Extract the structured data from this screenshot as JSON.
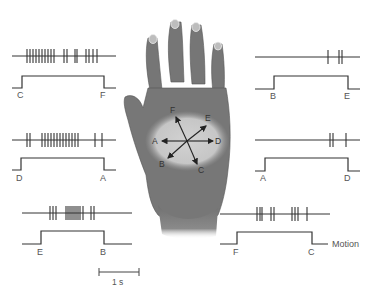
{
  "figure": {
    "scale_bar": {
      "label": "1 s"
    },
    "motion_label": "Motion",
    "hand": {
      "directions": [
        "A",
        "B",
        "C",
        "D",
        "E",
        "F"
      ],
      "arrows": [
        {
          "from": "center",
          "to": "A"
        },
        {
          "from": "center",
          "to": "B"
        },
        {
          "from": "center",
          "to": "C"
        },
        {
          "from": "center",
          "to": "D"
        },
        {
          "from": "center",
          "to": "E"
        },
        {
          "from": "center",
          "to": "F"
        }
      ]
    },
    "panels": [
      {
        "position": "top-left",
        "start": "C",
        "end": "F",
        "response": "strong"
      },
      {
        "position": "middle-left",
        "start": "D",
        "end": "A",
        "response": "strong"
      },
      {
        "position": "bottom-left",
        "start": "E",
        "end": "B",
        "response": "moderate"
      },
      {
        "position": "top-right",
        "start": "B",
        "end": "E",
        "response": "weak"
      },
      {
        "position": "middle-right",
        "start": "A",
        "end": "D",
        "response": "weak"
      },
      {
        "position": "bottom-right",
        "start": "F",
        "end": "C",
        "response": "moderate"
      }
    ]
  },
  "labels": {
    "tl_start": "C",
    "tl_end": "F",
    "ml_start": "D",
    "ml_end": "A",
    "bl_start": "E",
    "bl_end": "B",
    "tr_start": "B",
    "tr_end": "E",
    "mr_start": "A",
    "mr_end": "D",
    "br_start": "F",
    "br_end": "C",
    "dir_A": "A",
    "dir_B": "B",
    "dir_C": "C",
    "dir_D": "D",
    "dir_E": "E",
    "dir_F": "F",
    "scale": "1 s",
    "motion": "Motion"
  },
  "colors": {
    "trace": "#333333",
    "hand": "#7a7a7a",
    "hand_dark": "#5e5e5e",
    "palm_highlight": "#c9c9c9",
    "nail": "#b8b8b8"
  }
}
